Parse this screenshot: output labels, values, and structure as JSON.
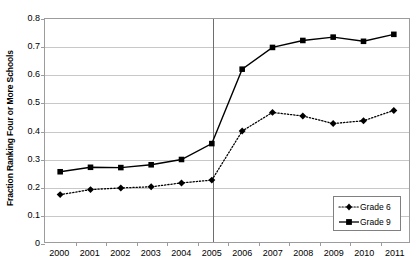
{
  "chart_data": {
    "type": "line",
    "title": "",
    "xlabel": "",
    "ylabel": "Fraction Ranking Four or More Schools",
    "categories": [
      "2000",
      "2001",
      "2002",
      "2003",
      "2004",
      "2005",
      "2006",
      "2007",
      "2008",
      "2009",
      "2010",
      "2011"
    ],
    "series": [
      {
        "name": "Grade 6",
        "marker": "diamond",
        "linestyle": "dotted",
        "color": "#000000",
        "values": [
          0.17,
          0.188,
          0.194,
          0.198,
          0.212,
          0.222,
          0.398,
          0.465,
          0.452,
          0.425,
          0.435,
          0.472
        ]
      },
      {
        "name": "Grade 9",
        "marker": "square",
        "linestyle": "solid",
        "color": "#000000",
        "values": [
          0.252,
          0.268,
          0.267,
          0.277,
          0.296,
          0.353,
          0.62,
          0.698,
          0.723,
          0.735,
          0.72,
          0.745
        ]
      }
    ],
    "ylim": [
      0,
      0.8
    ],
    "ytick_values": [
      0,
      0.1,
      0.2,
      0.3,
      0.4,
      0.5,
      0.6,
      0.7,
      0.8
    ],
    "ytick_labels": [
      "0",
      "0.1",
      "0.2",
      "0.3",
      "0.4",
      "0.5",
      "0.6",
      "0.7",
      "0.8"
    ],
    "grid": true,
    "legend_position": "bottom-right",
    "annotations": [
      {
        "type": "vertical-line",
        "x": "2005",
        "name": "year-2005-reference-line"
      }
    ]
  },
  "legend": {
    "entries": [
      {
        "label": "Grade 6"
      },
      {
        "label": "Grade 9"
      }
    ]
  }
}
